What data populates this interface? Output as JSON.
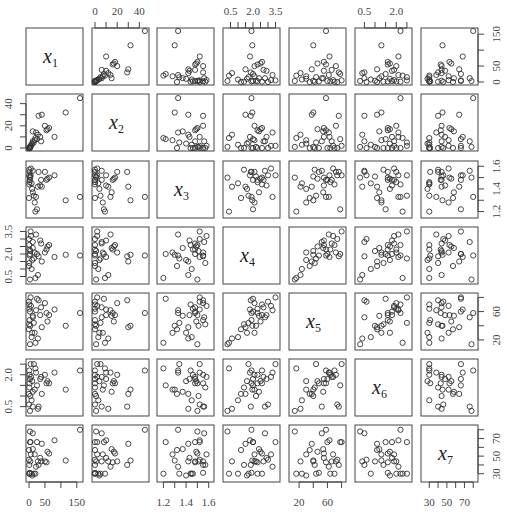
{
  "chart_data": {
    "type": "scatter",
    "subtype": "scatterplot-matrix",
    "title": "",
    "variables": [
      "x1",
      "x2",
      "x3",
      "x4",
      "x5",
      "x6",
      "x7"
    ],
    "diagonal_labels": [
      {
        "base": "x",
        "sub": "1"
      },
      {
        "base": "x",
        "sub": "2"
      },
      {
        "base": "x",
        "sub": "3"
      },
      {
        "base": "x",
        "sub": "4"
      },
      {
        "base": "x",
        "sub": "5"
      },
      {
        "base": "x",
        "sub": "6"
      },
      {
        "base": "x",
        "sub": "7"
      }
    ],
    "ranges": {
      "x1": [
        0,
        160
      ],
      "x2": [
        0,
        46
      ],
      "x3": [
        1.17,
        1.62
      ],
      "x4": [
        0.2,
        3.6
      ],
      "x5": [
        10,
        82
      ],
      "x6": [
        0.2,
        2.6
      ],
      "x7": [
        24,
        82
      ]
    },
    "axes": {
      "x1": {
        "ticks": [
          0,
          50,
          100,
          150
        ],
        "labels": [
          "0",
          "50",
          "150"
        ],
        "label_values": [
          0,
          50,
          150
        ],
        "side": "bottom+right"
      },
      "x2": {
        "ticks": [
          0,
          10,
          20,
          30,
          40
        ],
        "labels": [
          "0",
          "20",
          "40"
        ],
        "label_values": [
          0,
          20,
          40
        ],
        "side": "top+left"
      },
      "x3": {
        "ticks": [
          1.2,
          1.3,
          1.4,
          1.5,
          1.6
        ],
        "labels": [
          "1.2",
          "1.4",
          "1.6"
        ],
        "label_values": [
          1.2,
          1.4,
          1.6
        ],
        "side": "bottom+right"
      },
      "x4": {
        "ticks": [
          0.5,
          1.0,
          1.5,
          2.0,
          2.5,
          3.0,
          3.5
        ],
        "labels": [
          "0.5",
          "2.0",
          "3.5"
        ],
        "label_values": [
          0.5,
          2.0,
          3.5
        ],
        "side": "top+left"
      },
      "x5": {
        "ticks": [
          20,
          40,
          60,
          80
        ],
        "labels": [
          "20",
          "60"
        ],
        "label_values": [
          20,
          60
        ],
        "side": "bottom+right"
      },
      "x6": {
        "ticks": [
          0.5,
          1.0,
          1.5,
          2.0,
          2.5
        ],
        "labels": [
          "0.5",
          "2.0"
        ],
        "label_values": [
          0.5,
          2.0
        ],
        "side": "top+left"
      },
      "x7": {
        "ticks": [
          30,
          40,
          50,
          60,
          70,
          80
        ],
        "labels": [
          "30",
          "50",
          "70"
        ],
        "label_values": [
          30,
          50,
          70
        ],
        "side": "bottom+right"
      }
    },
    "observations": [
      {
        "x1": 160,
        "x2": 45,
        "x3": 1.33,
        "x4": 1.9,
        "x5": 58,
        "x6": 2.2,
        "x7": 80
      },
      {
        "x1": 115,
        "x2": 32,
        "x3": 1.3,
        "x4": 1.95,
        "x5": 40,
        "x6": 1.3,
        "x7": 45
      },
      {
        "x1": 80,
        "x2": 10,
        "x3": 1.52,
        "x4": 1.8,
        "x5": 63,
        "x6": 2.1,
        "x7": 68
      },
      {
        "x1": 63,
        "x2": 18,
        "x3": 1.5,
        "x4": 2.6,
        "x5": 55,
        "x6": 1.6,
        "x7": 53
      },
      {
        "x1": 58,
        "x2": 17,
        "x3": 1.49,
        "x4": 2.5,
        "x5": 46,
        "x6": 1.7,
        "x7": 55
      },
      {
        "x1": 55,
        "x2": 16,
        "x3": 1.48,
        "x4": 2.3,
        "x5": 58,
        "x6": 1.6,
        "x7": 43
      },
      {
        "x1": 50,
        "x2": 20,
        "x3": 1.55,
        "x4": 2.1,
        "x5": 72,
        "x6": 2.0,
        "x7": 44
      },
      {
        "x1": 40,
        "x2": 30,
        "x3": 1.42,
        "x4": 1.5,
        "x5": 38,
        "x6": 1.1,
        "x7": 64
      },
      {
        "x1": 35,
        "x2": 10,
        "x3": 1.43,
        "x4": 2.9,
        "x5": 55,
        "x6": 1.8,
        "x7": 48
      },
      {
        "x1": 38,
        "x2": 6,
        "x3": 1.48,
        "x4": 2.7,
        "x5": 66,
        "x6": 1.9,
        "x7": 44
      },
      {
        "x1": 30,
        "x2": 29,
        "x3": 1.55,
        "x4": 1.85,
        "x5": 76,
        "x6": 0.5,
        "x7": 40
      },
      {
        "x1": 28,
        "x2": 12,
        "x3": 1.42,
        "x4": 0.6,
        "x5": 22,
        "x6": 0.4,
        "x7": 44
      },
      {
        "x1": 25,
        "x2": 8,
        "x3": 1.22,
        "x4": 2.0,
        "x5": 78,
        "x6": 1.5,
        "x7": 66
      },
      {
        "x1": 20,
        "x2": 9,
        "x3": 1.2,
        "x4": 0.4,
        "x5": 16,
        "x6": 2.3,
        "x7": 30
      },
      {
        "x1": 18,
        "x2": 7,
        "x3": 1.28,
        "x4": 2.1,
        "x5": 30,
        "x6": 1.3,
        "x7": 52
      },
      {
        "x1": 15,
        "x2": 5,
        "x3": 1.34,
        "x4": 1.7,
        "x5": 44,
        "x6": 2.5,
        "x7": 30
      },
      {
        "x1": 12,
        "x2": 15,
        "x3": 1.37,
        "x4": 2.4,
        "x5": 54,
        "x6": 1.2,
        "x7": 58
      },
      {
        "x1": 10,
        "x2": 4,
        "x3": 1.4,
        "x4": 1.6,
        "x5": 30,
        "x6": 1.7,
        "x7": 28
      },
      {
        "x1": 8,
        "x2": 3,
        "x3": 1.45,
        "x4": 1.0,
        "x5": 24,
        "x6": 0.8,
        "x7": 30
      },
      {
        "x1": 6,
        "x2": 2,
        "x3": 1.58,
        "x4": 3.2,
        "x5": 68,
        "x6": 1.9,
        "x7": 52
      },
      {
        "x1": 5,
        "x2": 2,
        "x3": 1.52,
        "x4": 3.5,
        "x5": 80,
        "x6": 2.5,
        "x7": 66
      },
      {
        "x1": 4,
        "x2": 1,
        "x3": 1.51,
        "x4": 2.2,
        "x5": 40,
        "x6": 1.0,
        "x7": 44
      },
      {
        "x1": 3,
        "x2": 1,
        "x3": 1.5,
        "x4": 0.3,
        "x5": 14,
        "x6": 0.3,
        "x7": 78
      },
      {
        "x1": 3,
        "x2": 0,
        "x3": 1.48,
        "x4": 2.0,
        "x5": 60,
        "x6": 1.8,
        "x7": 66
      },
      {
        "x1": 2,
        "x2": 0,
        "x3": 1.46,
        "x4": 2.3,
        "x5": 64,
        "x6": 2.0,
        "x7": 30
      },
      {
        "x1": 2,
        "x2": 0,
        "x3": 1.55,
        "x4": 1.9,
        "x5": 48,
        "x6": 1.6,
        "x7": 31
      },
      {
        "x1": 1,
        "x2": 0,
        "x3": 1.44,
        "x4": 2.6,
        "x5": 70,
        "x6": 2.2,
        "x7": 30
      },
      {
        "x1": 1,
        "x2": 0,
        "x3": 1.57,
        "x4": 1.4,
        "x5": 42,
        "x6": 1.4,
        "x7": 40
      },
      {
        "x1": 0,
        "x2": 0,
        "x3": 1.52,
        "x4": 3.0,
        "x5": 74,
        "x6": 0.6,
        "x7": 46
      },
      {
        "x1": 0,
        "x2": 0,
        "x3": 1.32,
        "x4": 1.2,
        "x5": 35,
        "x6": 1.1,
        "x7": 57
      },
      {
        "x1": 12,
        "x2": 6,
        "x3": 1.56,
        "x4": 2.8,
        "x5": 52,
        "x6": 0.5,
        "x7": 76
      },
      {
        "x1": 22,
        "x2": 14,
        "x3": 1.33,
        "x4": 3.3,
        "x5": 62,
        "x6": 2.1,
        "x7": 38
      }
    ],
    "marker": {
      "shape": "open-circle",
      "color": "#333333",
      "radius": 2.6
    },
    "grid": false,
    "legend": null,
    "xlabel": "",
    "ylabel": ""
  },
  "layout": {
    "col_left": [
      26,
      92,
      157,
      223,
      289,
      355,
      421
    ],
    "row_top": [
      28,
      94,
      161,
      227,
      293,
      359,
      425
    ],
    "panel_size": 57
  }
}
